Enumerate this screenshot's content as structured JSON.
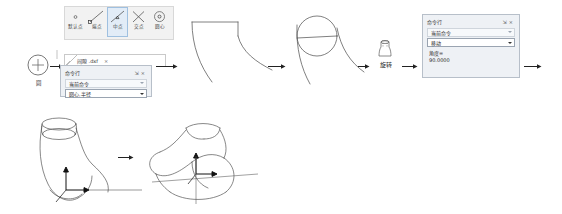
{
  "document": {
    "kind": "cad-workflow-diagram",
    "language": "zh-CN"
  },
  "osnap_toolbar": {
    "name": "object-snap-toolbar",
    "buttons": [
      {
        "label": "默认点",
        "icon": "snap-point-icon",
        "selected": false
      },
      {
        "label": "端点",
        "icon": "snap-endpoint-icon",
        "selected": false
      },
      {
        "label": "中点",
        "icon": "snap-midpoint-icon",
        "selected": true
      },
      {
        "label": "交点",
        "icon": "snap-intersection-icon",
        "selected": false
      },
      {
        "label": "圆心",
        "icon": "snap-center-icon",
        "selected": false
      }
    ]
  },
  "tab_strip": {
    "title": "间隙 .dxf",
    "close_label": "×"
  },
  "panel_circle": {
    "title": "命令行",
    "pin_label": "⇲",
    "close_label": "×",
    "current_command_label": "当前命令",
    "command_value": "圆心,半径"
  },
  "panel_rotate": {
    "title": "命令行",
    "pin_label": "⇲",
    "close_label": "×",
    "current_command_label": "当前命令",
    "command_value": "移动",
    "angle_label": "角度=",
    "angle_value": "90.0000"
  },
  "steps": {
    "circle_tool_label": "圆",
    "rotate_label": "旋转"
  },
  "colors": {
    "panel_bg": "#eef1f5",
    "panel_border": "#b7bfc9",
    "toolbar_bg": "#f2f2f2",
    "selected_bg": "#e2ecf7",
    "selected_border": "#9fc0e0",
    "sketch_stroke": "#555555",
    "text": "#1f1f1f"
  }
}
